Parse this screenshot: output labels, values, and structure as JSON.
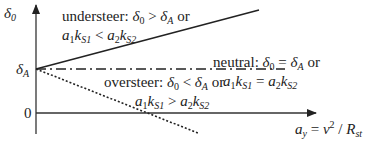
{
  "diagram": {
    "y_axis": {
      "label": "δ0",
      "label_main": "δ",
      "label_sub": "0"
    },
    "x_axis": {
      "label": "a_y = v^2 / R_st"
    },
    "ticks": {
      "delta_a": {
        "main": "δ",
        "sub": "A"
      },
      "zero": "0"
    },
    "curves": [
      {
        "name": "understeer",
        "style": "solid",
        "line1": "understeer: δ0 > δA or",
        "line2": "a1 kS1 < a2 kS2"
      },
      {
        "name": "neutral",
        "style": "dash-dot",
        "line1": "neutral: δ0 = δA or",
        "line2": "a1 kS1 = a2 kS2"
      },
      {
        "name": "oversteer",
        "style": "dotted",
        "line1": "oversteer: δ0 < δA or",
        "line2": "a1 kS1 > a2 kS2"
      }
    ],
    "texts": {
      "understeer_word": "understeer:",
      "neutral_word": "neutral:",
      "oversteer_word": "oversteer:",
      "or": "or",
      "gt": ">",
      "lt": "<",
      "eq": "="
    }
  }
}
